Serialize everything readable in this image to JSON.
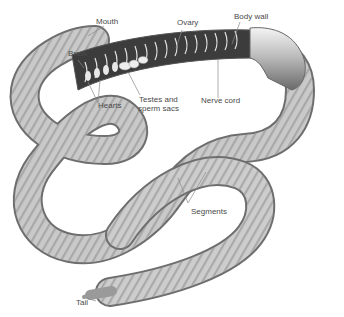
{
  "labels": {
    "mouth": "Mouth",
    "brain": "Brain",
    "hearts": "Hearts",
    "testes_line1": "Testes and",
    "testes_line2": "sperm sacs",
    "ovary": "Ovary",
    "body_wall": "Body wall",
    "nerve_cord": "Nerve cord",
    "segments": "Segments",
    "tail": "Tail"
  },
  "colors": {
    "body_light": "#e4e4e4",
    "body_mid": "#b8b8b8",
    "body_dark": "#7a7a7a",
    "interior": "#3a3a3a",
    "label_text": "#4a4a4a",
    "leader_line": "#8a8a8a"
  }
}
